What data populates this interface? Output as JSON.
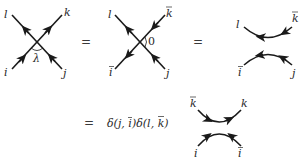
{
  "equation": {
    "row1": {
      "diagram1": {
        "type": "vertex-crossing",
        "labels": {
          "top_left": "l",
          "top_right": "k",
          "bottom_left": "i",
          "bottom_right": "j"
        },
        "angle_label": "λ",
        "arrows": "i→k up-right; j→l up-left"
      },
      "eq1": "=",
      "diagram2": {
        "type": "vertex-crossing",
        "labels": {
          "top_left": "l",
          "top_right": "k",
          "bottom_left": "i",
          "bottom_right": "j"
        },
        "overbar_labels": [
          "top_right",
          "bottom_left"
        ],
        "angle_label": "0",
        "arrows": "j→l up-left; k̄→ī down-left"
      },
      "eq2": "=",
      "diagram3": {
        "type": "two-arcs",
        "labels": {
          "top_left": "l",
          "top_right": "k",
          "bottom_left": "i",
          "bottom_right": "j"
        },
        "overbar_labels": [
          "top_right",
          "bottom_left"
        ],
        "arrows": "top arc leftward; bottom arc leftward"
      }
    },
    "row2": {
      "eq": "=",
      "formula": {
        "delta1": "δ(j, ī)",
        "delta2": "δ(l, k̄)",
        "parts": [
          "δ(",
          "j",
          ", ",
          "i",
          ")δ(",
          "l",
          ", ",
          "k",
          ")"
        ]
      },
      "diagram4": {
        "type": "two-arcs",
        "labels": {
          "top_left": "k",
          "top_right": "k",
          "bottom_left": "i",
          "bottom_right": "i"
        },
        "overbar_labels": [
          "top_left",
          "bottom_right"
        ],
        "arrows": "top arc rightward; bottom arc toward top from both ends"
      }
    }
  }
}
